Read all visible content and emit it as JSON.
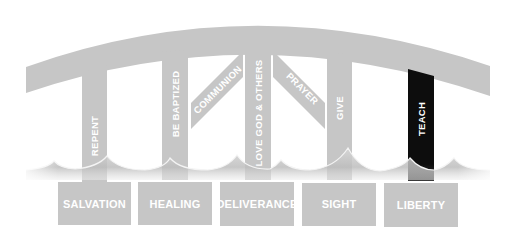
{
  "colors": {
    "gray": "#c6c6c6",
    "gray_dark": "#b4b4b4",
    "black": "#0d0d0d",
    "label": "#ffffff",
    "background": "#ffffff"
  },
  "arch": {
    "label": ""
  },
  "pillars": [
    {
      "id": "repent",
      "label": "REPENT",
      "style": "vertical"
    },
    {
      "id": "be-baptized",
      "label": "BE BAPTIZED",
      "style": "vertical"
    },
    {
      "id": "communion",
      "label": "COMMUNION",
      "style": "diagonal"
    },
    {
      "id": "love-god-others",
      "label": "LOVE GOD & OTHERS",
      "style": "vertical"
    },
    {
      "id": "prayer",
      "label": "PRAYER",
      "style": "diagonal"
    },
    {
      "id": "give",
      "label": "GIVE",
      "style": "vertical"
    },
    {
      "id": "teach",
      "label": "TEACH",
      "style": "vertical-highlight"
    }
  ],
  "boxes": [
    {
      "id": "salvation",
      "label": "SALVATION"
    },
    {
      "id": "healing",
      "label": "HEALING"
    },
    {
      "id": "deliverance",
      "label": "DELIVERANCE"
    },
    {
      "id": "sight",
      "label": "SIGHT"
    },
    {
      "id": "liberty",
      "label": "LIBERTY"
    }
  ]
}
